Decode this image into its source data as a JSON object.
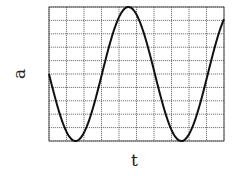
{
  "chart_data": {
    "type": "line",
    "title": "",
    "xlabel": "t",
    "ylabel": "a",
    "grid": true,
    "x_divisions": 10,
    "y_divisions": 10,
    "xlim": [
      0,
      10
    ],
    "ylim": [
      -5,
      5
    ],
    "tick_labels_shown": false,
    "series": [
      {
        "name": "a(t)",
        "description": "sinusoid, amplitude 5 grid units, period ~6 grid units, starting at 0 and decreasing",
        "x": [
          0,
          0.75,
          1.5,
          2.25,
          3.0,
          3.75,
          4.5,
          5.25,
          6.0,
          6.75,
          7.5,
          8.25,
          9.0,
          9.75,
          10.0
        ],
        "values": [
          0,
          -3.5,
          -5,
          -3.5,
          0,
          3.5,
          5,
          3.5,
          0,
          -3.5,
          -5,
          -3.5,
          0,
          3.5,
          4.3
        ]
      }
    ]
  },
  "labels": {
    "x": "t",
    "y": "a"
  },
  "colors": {
    "grid": "#444444",
    "curve": "#111111",
    "background": "#ffffff"
  }
}
